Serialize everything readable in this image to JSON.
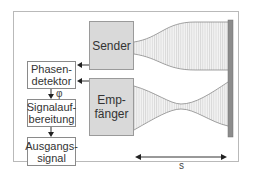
{
  "diagram": {
    "blocks": {
      "sender": "Sender",
      "empfaenger": "Emp-\nfänger",
      "phasendetektor": "Phasen-\ndetektor",
      "signalaufbereitung": "Signalauf-\nbereitung",
      "ausgangssignal": "Ausgangs-\nsignal"
    },
    "labels": {
      "phase": "φ",
      "distance": "s"
    },
    "colors": {
      "block_fill": "#d9d9d9",
      "reflector": "#8c8c8c",
      "wave_fill": "#f0f0f0",
      "wave_lines": "#bdbdbd",
      "outline": "#8a8a8a"
    }
  }
}
